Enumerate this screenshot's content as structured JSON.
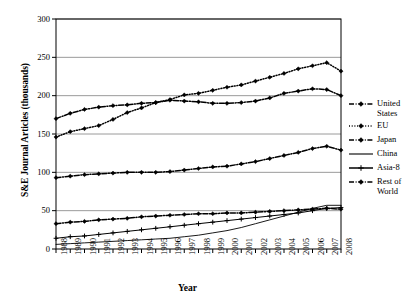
{
  "chart_data": {
    "type": "line",
    "title": "",
    "xlabel": "Year",
    "ylabel": "S&E Journal Articles (thousands)",
    "xlim": [
      1988,
      2008
    ],
    "ylim": [
      0,
      300
    ],
    "yticks": [
      0,
      50,
      100,
      150,
      200,
      250,
      300
    ],
    "grid": "horizontal",
    "legend_position": "right",
    "categories": [
      "1988",
      "1989",
      "1990",
      "1991",
      "1992",
      "1993",
      "1994",
      "1995",
      "1996",
      "1997",
      "1998",
      "1999",
      "2000",
      "2001",
      "2002",
      "2003",
      "2004",
      "2005",
      "2006",
      "2007",
      "2008"
    ],
    "series": [
      {
        "name": "United States",
        "style": "dash-dot",
        "marker": "diamond",
        "values": [
          170,
          177,
          182,
          185,
          187,
          188,
          190,
          191,
          194,
          193,
          192,
          190,
          190,
          191,
          193,
          197,
          203,
          206,
          209,
          208,
          200
        ]
      },
      {
        "name": "EU",
        "style": "dotted",
        "marker": "diamond",
        "values": [
          146,
          153,
          157,
          161,
          169,
          178,
          184,
          191,
          195,
          201,
          203,
          207,
          211,
          214,
          219,
          224,
          229,
          235,
          239,
          243,
          232
        ]
      },
      {
        "name": "Japan",
        "style": "dash-dot",
        "marker": "diamond",
        "values": [
          93,
          95,
          97,
          98,
          99,
          100,
          100,
          100,
          101,
          103,
          105,
          107,
          108,
          111,
          114,
          118,
          122,
          126,
          131,
          134,
          129
        ]
      },
      {
        "name": "China",
        "style": "solid",
        "marker": "none",
        "values": [
          6,
          7,
          8,
          9,
          10,
          11,
          12,
          13,
          14,
          16,
          18,
          21,
          24,
          28,
          33,
          38,
          43,
          48,
          53,
          57,
          57
        ]
      },
      {
        "name": "Asia-8",
        "style": "solid",
        "marker": "plus",
        "values": [
          14,
          16,
          17,
          19,
          21,
          23,
          25,
          27,
          29,
          31,
          33,
          35,
          37,
          39,
          41,
          43,
          45,
          47,
          50,
          53,
          54
        ]
      },
      {
        "name": "Rest of World",
        "style": "dash-dot",
        "marker": "diamond",
        "values": [
          33,
          35,
          36,
          38,
          39,
          40,
          42,
          43,
          44,
          45,
          46,
          46,
          47,
          47,
          48,
          49,
          50,
          51,
          52,
          53,
          52
        ]
      }
    ]
  },
  "legend": {
    "items": [
      {
        "label": "United States"
      },
      {
        "label": "EU"
      },
      {
        "label": "Japan"
      },
      {
        "label": "China"
      },
      {
        "label": "Asia-8"
      },
      {
        "label": "Rest of World"
      }
    ]
  },
  "colors": {
    "line": "#000000",
    "grid": "#808080",
    "axis": "#000000",
    "background": "#ffffff"
  }
}
